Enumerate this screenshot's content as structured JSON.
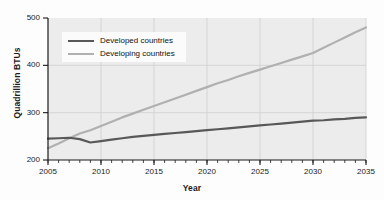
{
  "chart_data": {
    "type": "line",
    "title": "",
    "xlabel": "Year",
    "ylabel": "Quadrillion BTUs",
    "xlim": [
      2005,
      2035
    ],
    "ylim": [
      200,
      500
    ],
    "xticks": [
      2005,
      2010,
      2015,
      2020,
      2025,
      2030,
      2035
    ],
    "yticks": [
      200,
      300,
      400,
      500
    ],
    "xtick_labels": [
      "2005",
      "2010",
      "2015",
      "2020",
      "2025",
      "2030",
      "2035"
    ],
    "ytick_labels": [
      "200",
      "300",
      "400",
      "500"
    ],
    "minor_xtick_step": 1,
    "grid": "both",
    "legend_position": "upper-left-inside",
    "x": [
      2005,
      2006,
      2007,
      2008,
      2009,
      2010,
      2011,
      2012,
      2013,
      2014,
      2015,
      2016,
      2017,
      2018,
      2019,
      2020,
      2021,
      2022,
      2023,
      2024,
      2025,
      2026,
      2027,
      2028,
      2029,
      2030,
      2031,
      2032,
      2033,
      2034,
      2035
    ],
    "series": [
      {
        "name": "Developed countries",
        "color": "#585858",
        "linewidth": 2.2,
        "values": [
          245,
          246,
          247,
          244,
          237,
          240,
          243,
          246,
          249,
          251,
          253,
          255,
          257,
          259,
          261,
          263,
          265,
          267,
          269,
          271,
          273,
          275,
          277,
          279,
          281,
          283,
          284,
          286,
          287,
          289,
          290
        ]
      },
      {
        "name": "Developing countries",
        "color": "#b0b0b0",
        "linewidth": 2.2,
        "values": [
          225,
          235,
          246,
          256,
          263,
          272,
          281,
          290,
          298,
          306,
          314,
          322,
          330,
          338,
          346,
          354,
          362,
          369,
          377,
          384,
          391,
          398,
          405,
          412,
          419,
          426,
          437,
          448,
          459,
          470,
          480
        ]
      }
    ]
  },
  "legend": {
    "items": [
      {
        "label": "Developed countries",
        "color": "#585858"
      },
      {
        "label": "Developing countries",
        "color": "#b0b0b0"
      }
    ]
  },
  "style": {
    "plot_background": "#ececec",
    "grid_color": "#d3d3d3",
    "axis_color": "#1a1a1a",
    "figure_background": "#fdfdfd"
  }
}
